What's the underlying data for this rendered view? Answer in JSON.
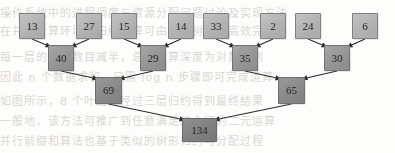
{
  "figure": {
    "width": 395,
    "height": 153,
    "background_color": "#fdfdfc",
    "edge_color": "#2b2b2b",
    "leaf_fill": "#b7b7b7",
    "level2_fill": "#9a9a9a",
    "level3_fill": "#8c8c8c",
    "root_fill": "#838383",
    "label_color": "#18181a"
  },
  "chart_data": {
    "type": "diagram",
    "levels": 4,
    "nodes": [
      {
        "id": "L0",
        "label": "13",
        "level": 1,
        "x": 19,
        "y": 13,
        "w": 26,
        "h": 26
      },
      {
        "id": "L1",
        "label": "27",
        "level": 1,
        "x": 76,
        "y": 13,
        "w": 26,
        "h": 26
      },
      {
        "id": "L2",
        "label": "15",
        "level": 1,
        "x": 111,
        "y": 13,
        "w": 26,
        "h": 26
      },
      {
        "id": "L3",
        "label": "14",
        "level": 1,
        "x": 168,
        "y": 13,
        "w": 26,
        "h": 26
      },
      {
        "id": "L4",
        "label": "33",
        "level": 1,
        "x": 203,
        "y": 13,
        "w": 26,
        "h": 26
      },
      {
        "id": "L5",
        "label": "2",
        "level": 1,
        "x": 260,
        "y": 13,
        "w": 26,
        "h": 26
      },
      {
        "id": "L6",
        "label": "24",
        "level": 1,
        "x": 295,
        "y": 13,
        "w": 26,
        "h": 26
      },
      {
        "id": "L7",
        "label": "6",
        "level": 1,
        "x": 352,
        "y": 13,
        "w": 26,
        "h": 26
      },
      {
        "id": "M0",
        "label": "40",
        "level": 2,
        "x": 48,
        "y": 45,
        "w": 26,
        "h": 26
      },
      {
        "id": "M1",
        "label": "29",
        "level": 2,
        "x": 140,
        "y": 45,
        "w": 26,
        "h": 26
      },
      {
        "id": "M2",
        "label": "35",
        "level": 2,
        "x": 232,
        "y": 45,
        "w": 26,
        "h": 26
      },
      {
        "id": "M3",
        "label": "30",
        "level": 2,
        "x": 324,
        "y": 45,
        "w": 26,
        "h": 26
      },
      {
        "id": "N0",
        "label": "69",
        "level": 3,
        "x": 95,
        "y": 77,
        "w": 27,
        "h": 27
      },
      {
        "id": "N1",
        "label": "65",
        "level": 3,
        "x": 278,
        "y": 77,
        "w": 27,
        "h": 27
      },
      {
        "id": "R",
        "label": "134",
        "level": 4,
        "x": 182,
        "y": 118,
        "w": 35,
        "h": 24
      }
    ],
    "edges": [
      {
        "from": "L0",
        "to": "M0"
      },
      {
        "from": "L1",
        "to": "M0"
      },
      {
        "from": "L2",
        "to": "M1"
      },
      {
        "from": "L3",
        "to": "M1"
      },
      {
        "from": "L4",
        "to": "M2"
      },
      {
        "from": "L5",
        "to": "M2"
      },
      {
        "from": "L6",
        "to": "M3"
      },
      {
        "from": "L7",
        "to": "M3"
      },
      {
        "from": "M0",
        "to": "N0"
      },
      {
        "from": "M1",
        "to": "N0"
      },
      {
        "from": "M2",
        "to": "N1"
      },
      {
        "from": "M3",
        "to": "N1"
      },
      {
        "from": "N0",
        "to": "R"
      },
      {
        "from": "N1",
        "to": "R"
      }
    ],
    "leaf_values": [
      13,
      27,
      15,
      14,
      33,
      2,
      24,
      6
    ],
    "level2_values": [
      40,
      29,
      35,
      30
    ],
    "level3_values": [
      69,
      65
    ],
    "root_value": 134
  },
  "background_bleed": {
    "note": "faint reversed print showing through the scanned page",
    "lines": [
      {
        "top": 4,
        "text": "操作系统中的进程调度与资源分配问题讨论及实现方法"
      },
      {
        "top": 22,
        "text": "在并行计算环境下归约运算可由二叉树结构高效完成"
      },
      {
        "top": 48,
        "text": "每一层的结点数目减半，总的计算深度为对数级别"
      },
      {
        "top": 68,
        "text": "因此 n 个数据求和，只需 log n 步骤即可完成运算"
      },
      {
        "top": 92,
        "text": "如图所示，8 个叶结点经过三层归约得到最终结果"
      },
      {
        "top": 112,
        "text": "一般地，该方法可推广到任意满足结合律的二元运算"
      },
      {
        "top": 132,
        "text": "并行前缀和算法也基于类似的树形归约与分配过程"
      }
    ]
  }
}
